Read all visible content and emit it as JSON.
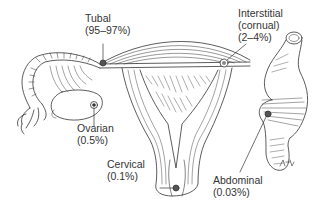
{
  "diagram": {
    "ink_color": "#333333",
    "background": "#ffffff",
    "labels": [
      {
        "id": "tubal",
        "name": "Tubal",
        "value": "(95–97%)"
      },
      {
        "id": "interstitial",
        "name": "Interstitial",
        "alt": "(cornual)",
        "value": "(2–4%)"
      },
      {
        "id": "ovarian",
        "name": "Ovarian",
        "value": "(0.5%)"
      },
      {
        "id": "cervical",
        "name": "Cervical",
        "value": "(0.1%)"
      },
      {
        "id": "abdominal",
        "name": "Abdominal",
        "value": "(0.03%)"
      }
    ],
    "signature": "artist signature"
  }
}
